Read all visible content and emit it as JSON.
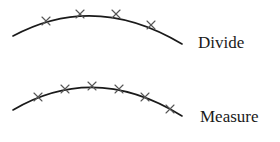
{
  "diagram": {
    "colors": {
      "curve": "#1a1a1a",
      "mark": "#555555",
      "text": "#1a1a1a",
      "background": "#ffffff"
    },
    "panels": [
      {
        "label": "Divide",
        "curve_path": "M13,36 Q95,-8 182,44",
        "marks": [
          [
            46,
            21
          ],
          [
            80,
            14
          ],
          [
            116,
            14
          ],
          [
            151,
            25
          ]
        ],
        "label_pos": [
          198,
          48
        ]
      },
      {
        "label": "Measure",
        "curve_path": "M13,110 Q95,62 182,116",
        "marks": [
          [
            38,
            97
          ],
          [
            65,
            89
          ],
          [
            92,
            86
          ],
          [
            119,
            89
          ],
          [
            145,
            97
          ],
          [
            170,
            109
          ]
        ],
        "label_pos": [
          200,
          122
        ]
      }
    ]
  }
}
